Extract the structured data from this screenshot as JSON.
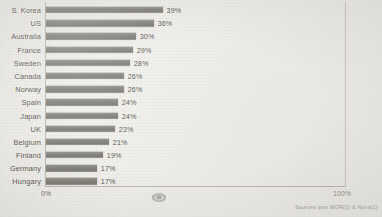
{
  "chart_data": {
    "type": "bar",
    "orientation": "horizontal",
    "title": "",
    "subtitle": "",
    "xlabel": "",
    "ylabel": "",
    "xlim": [
      0,
      100
    ],
    "grid": false,
    "legend": null,
    "categories": [
      "S. Korea",
      "US",
      "Australia",
      "France",
      "Sweden",
      "Canada",
      "Norway",
      "Spain",
      "Japan",
      "UK",
      "Belgium",
      "Finland",
      "Germany",
      "Hungary"
    ],
    "values": [
      39,
      36,
      30,
      29,
      28,
      26,
      26,
      24,
      24,
      23,
      21,
      19,
      17,
      17
    ],
    "value_labels": [
      "39%",
      "36%",
      "30%",
      "29%",
      "28%",
      "26%",
      "26%",
      "24%",
      "24%",
      "23%",
      "21%",
      "19%",
      "17%",
      "17%"
    ],
    "axis_ticks": [
      "0%",
      "100%"
    ],
    "bar_color": "#76746d",
    "background_color": "#efeeea",
    "text_color": "#4a4842"
  },
  "axis": {
    "min_label": "0%",
    "max_label": "100%"
  },
  "footer": {
    "source": "Sources ipsx MOR(1) & Nova(1)"
  },
  "watermark": {
    "icon": "oval-logo-watermark"
  }
}
